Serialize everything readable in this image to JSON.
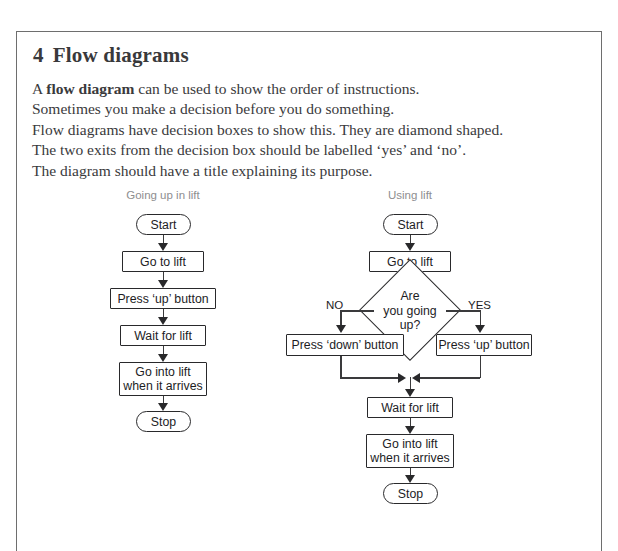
{
  "page": {
    "section_number": "4",
    "heading": "Flow diagrams",
    "paragraph_lines": [
      {
        "pre": "A ",
        "bold": "flow diagram",
        "post": " can be used to show the order of instructions."
      },
      {
        "pre": "Sometimes you make a decision before you do something.",
        "bold": "",
        "post": ""
      },
      {
        "pre": "Flow diagrams have decision boxes to show this. They are diamond shaped.",
        "bold": "",
        "post": ""
      },
      {
        "pre": "The two exits from the decision box should be labelled ‘yes’ and ‘no’.",
        "bold": "",
        "post": ""
      },
      {
        "pre": "The diagram should have a title explaining its purpose.",
        "bold": "",
        "post": ""
      }
    ]
  },
  "diagrams": [
    {
      "id": "going-up-in-lift",
      "title": "Going up in lift",
      "nodes": [
        {
          "name": "start",
          "shape": "terminal",
          "label": "Start"
        },
        {
          "name": "go-to-lift",
          "shape": "process",
          "label": "Go to lift"
        },
        {
          "name": "press-up",
          "shape": "process",
          "label": "Press ‘up’ button"
        },
        {
          "name": "wait",
          "shape": "process",
          "label": "Wait for lift"
        },
        {
          "name": "go-into-lift",
          "shape": "process",
          "label": "Go into lift\nwhen it arrives"
        },
        {
          "name": "stop",
          "shape": "terminal",
          "label": "Stop"
        }
      ]
    },
    {
      "id": "using-lift",
      "title": "Using lift",
      "nodes": [
        {
          "name": "start",
          "shape": "terminal",
          "label": "Start"
        },
        {
          "name": "go-to-lift",
          "shape": "process",
          "label": "Go to lift"
        },
        {
          "name": "decision",
          "shape": "decision",
          "label": "Are\nyou going\nup?"
        },
        {
          "name": "press-down",
          "shape": "process",
          "label": "Press ‘down’ button"
        },
        {
          "name": "press-up",
          "shape": "process",
          "label": "Press ‘up’ button"
        },
        {
          "name": "wait",
          "shape": "process",
          "label": "Wait for lift"
        },
        {
          "name": "go-into-lift",
          "shape": "process",
          "label": "Go into lift\nwhen it arrives"
        },
        {
          "name": "stop",
          "shape": "terminal",
          "label": "Stop"
        }
      ],
      "branch_labels": {
        "no": "NO",
        "yes": "YES"
      }
    }
  ],
  "colors": {
    "page_border": "#6e6e6e",
    "heading_text": "#39393b",
    "body_text": "#3a3a3c",
    "diagram_title": "#8e8e90",
    "node_border": "#29292b",
    "connector": "#3a3a3c",
    "background": "#ffffff"
  }
}
